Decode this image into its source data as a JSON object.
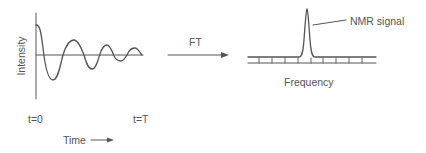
{
  "diagram": {
    "colors": {
      "line": "#555555",
      "text": "#555555",
      "background": "#ffffff"
    },
    "time_domain": {
      "ylabel": "Intensity",
      "xlabel": "Time",
      "start_label": "t=0",
      "end_label": "t=T",
      "signal": "damped-oscillation"
    },
    "transform": {
      "label": "FT",
      "arrow": "right-arrow"
    },
    "frequency_domain": {
      "xlabel": "Frequency",
      "peak_label": "NMR signal",
      "tick_count": 9
    }
  }
}
